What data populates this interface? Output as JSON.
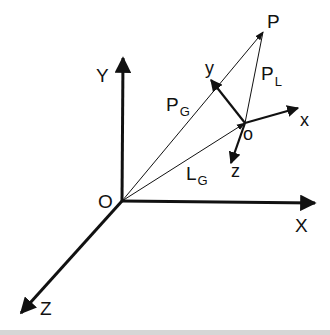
{
  "diagram": {
    "colors": {
      "ink": "#111111",
      "background": "#ffffff",
      "footer_band": "#d6d6d6"
    },
    "global_frame": {
      "origin_label": "O",
      "x_axis_label": "X",
      "y_axis_label": "Y",
      "z_axis_label": "Z"
    },
    "local_frame": {
      "origin_label": "o",
      "x_axis_label": "x",
      "y_axis_label": "y",
      "z_axis_label": "z"
    },
    "point": {
      "label": "P"
    },
    "vectors": {
      "p_global": {
        "base": "P",
        "sub": "G"
      },
      "p_local": {
        "base": "P",
        "sub": "L"
      },
      "l_global": {
        "base": "L",
        "sub": "G"
      }
    }
  }
}
